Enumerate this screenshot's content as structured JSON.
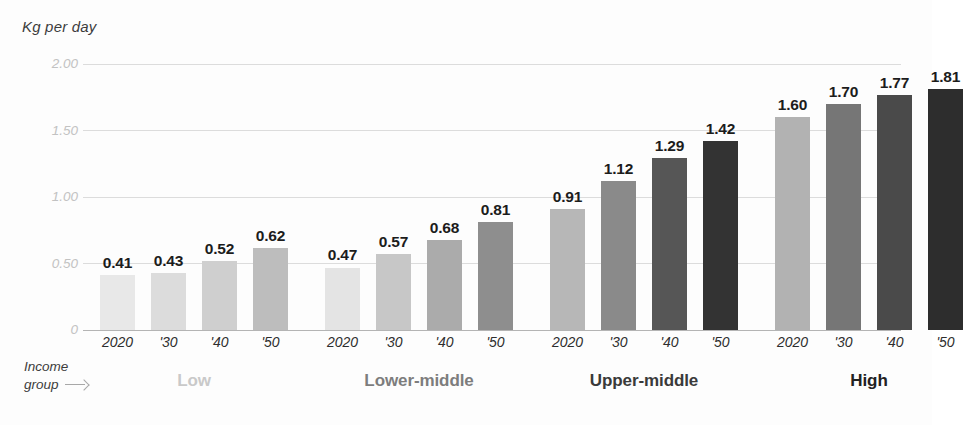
{
  "chart_data": {
    "type": "bar",
    "title": "",
    "ylabel": "Kg per day",
    "xlabel": "Income group",
    "ylim": [
      0,
      2.0
    ],
    "grid": true,
    "legend": "none",
    "ytick_labels": [
      "2.00",
      "1.50",
      "1.00",
      "0.50",
      "0"
    ],
    "ytick_values": [
      2.0,
      1.5,
      1.0,
      0.5,
      0
    ],
    "categories": [
      "2020",
      "'30",
      "'40",
      "'50"
    ],
    "groups": [
      {
        "name": "Low",
        "label_color": "#c9c9c9",
        "bars": [
          {
            "category": "2020",
            "value": 0.41,
            "label": "0.41",
            "color": "#e8e8e8"
          },
          {
            "category": "'30",
            "value": 0.43,
            "label": "0.43",
            "color": "#dcdcdc"
          },
          {
            "category": "'40",
            "value": 0.52,
            "label": "0.52",
            "color": "#cfcfcf"
          },
          {
            "category": "'50",
            "value": 0.62,
            "label": "0.62",
            "color": "#bdbdbd"
          }
        ]
      },
      {
        "name": "Lower-middle",
        "label_color": "#7d7d7d",
        "bars": [
          {
            "category": "2020",
            "value": 0.47,
            "label": "0.47",
            "color": "#e4e4e4"
          },
          {
            "category": "'30",
            "value": 0.57,
            "label": "0.57",
            "color": "#c7c7c7"
          },
          {
            "category": "'40",
            "value": 0.68,
            "label": "0.68",
            "color": "#ababab"
          },
          {
            "category": "'50",
            "value": 0.81,
            "label": "0.81",
            "color": "#8e8e8e"
          }
        ]
      },
      {
        "name": "Upper-middle",
        "label_color": "#3a3a3a",
        "bars": [
          {
            "category": "2020",
            "value": 0.91,
            "label": "0.91",
            "color": "#b7b7b7"
          },
          {
            "category": "'30",
            "value": 1.12,
            "label": "1.12",
            "color": "#8a8a8a"
          },
          {
            "category": "'40",
            "value": 1.29,
            "label": "1.29",
            "color": "#565656"
          },
          {
            "category": "'50",
            "value": 1.42,
            "label": "1.42",
            "color": "#333333"
          }
        ]
      },
      {
        "name": "High",
        "label_color": "#222222",
        "bars": [
          {
            "category": "2020",
            "value": 1.6,
            "label": "1.60",
            "color": "#b2b2b2"
          },
          {
            "category": "'30",
            "value": 1.7,
            "label": "1.70",
            "color": "#767676"
          },
          {
            "category": "'40",
            "value": 1.77,
            "label": "1.77",
            "color": "#4a4a4a"
          },
          {
            "category": "'50",
            "value": 1.81,
            "label": "1.81",
            "color": "#2d2d2d"
          }
        ]
      }
    ]
  },
  "axis_caption": {
    "line1": "Income",
    "line2": "group",
    "arrow": "arrow-right-icon"
  },
  "layout": {
    "baseline_y": 330,
    "top_y": 64,
    "grid_left": 83,
    "grid_right": 901,
    "bar_width": 35,
    "bar_gap": 16,
    "group_gap": 37,
    "first_bar_x": 100
  }
}
